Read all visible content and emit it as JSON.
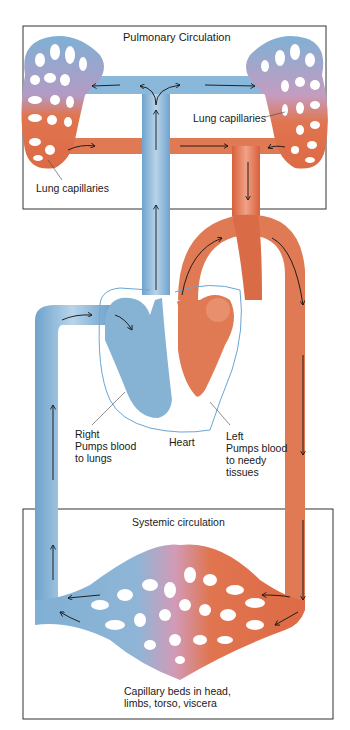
{
  "pulmonary": {
    "box_title": "Pulmonary Circulation",
    "left_label": "Lung capillaries",
    "right_label": "Lung capillaries"
  },
  "heart": {
    "label": "Heart",
    "right_side": "Right\nPumps blood\nto lungs",
    "left_side": "Left\nPumps blood\nto needy\ntissues"
  },
  "systemic": {
    "box_title": "Systemic circulation",
    "capillary_label": "Capillary beds in head,\nlimbs, torso, viscera"
  },
  "colors": {
    "deoxygenated": "#8db8d8",
    "oxygenated": "#e0704f",
    "mixed": "#c99ab8",
    "outline": "#333333"
  }
}
